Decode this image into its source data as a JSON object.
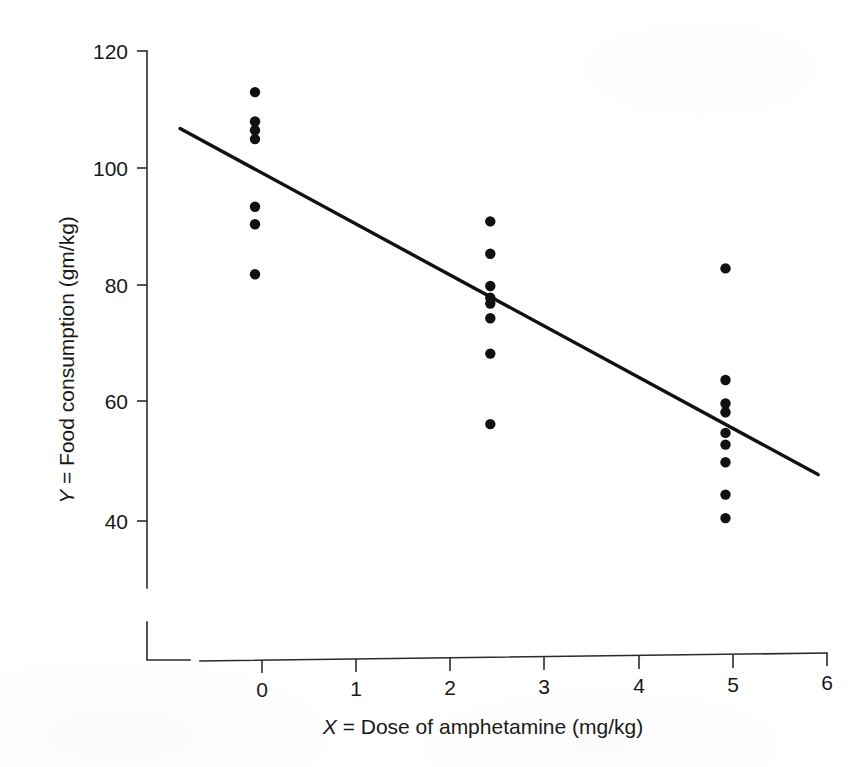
{
  "figure": {
    "name": "amphetamine-dose-food-consumption-scatter",
    "background_color": "#ffffff",
    "ink_color": "#101010"
  },
  "chart_data": {
    "type": "scatter",
    "title": "",
    "subtitle": "",
    "xlabel": "X = Dose of amphetamine (mg/kg)",
    "ylabel": "Y = Food consumption (gm/kg)",
    "xlabel_variable": "X",
    "xlabel_rest": " = Dose of amphetamine (mg/kg)",
    "ylabel_variable": "Y",
    "ylabel_rest": " = Food consumption (gm/kg)",
    "xlim": [
      0,
      6
    ],
    "ylim": [
      33,
      122
    ],
    "y_axis_broken": true,
    "grid": false,
    "legend": null,
    "xticks": [
      0,
      1,
      2,
      3,
      4,
      5,
      6
    ],
    "xtick_labels": [
      "0",
      "1",
      "2",
      "3",
      "4",
      "5",
      "6"
    ],
    "yticks": [
      40,
      60,
      80,
      100,
      120
    ],
    "ytick_labels": [
      "40",
      "60",
      "80",
      "100",
      "120"
    ],
    "groups": [
      {
        "name": "dose-0",
        "x": 0,
        "values": [
          113.0,
          108.0,
          106.5,
          105.0,
          93.5,
          90.5,
          82.0
        ]
      },
      {
        "name": "dose-2.5",
        "x": 2.5,
        "values": [
          91.0,
          85.5,
          80.0,
          78.0,
          77.0,
          74.5,
          68.5,
          56.5
        ]
      },
      {
        "name": "dose-5",
        "x": 5,
        "values": [
          83.0,
          64.0,
          60.0,
          58.5,
          55.0,
          53.0,
          50.0,
          44.5,
          40.5
        ]
      }
    ],
    "points": [
      {
        "x": 0,
        "y": 113.0
      },
      {
        "x": 0,
        "y": 108.0
      },
      {
        "x": 0,
        "y": 106.5
      },
      {
        "x": 0,
        "y": 105.0
      },
      {
        "x": 0,
        "y": 93.5
      },
      {
        "x": 0,
        "y": 90.5
      },
      {
        "x": 0,
        "y": 82.0
      },
      {
        "x": 2.5,
        "y": 91.0
      },
      {
        "x": 2.5,
        "y": 85.5
      },
      {
        "x": 2.5,
        "y": 80.0
      },
      {
        "x": 2.5,
        "y": 78.0
      },
      {
        "x": 2.5,
        "y": 77.0
      },
      {
        "x": 2.5,
        "y": 74.5
      },
      {
        "x": 2.5,
        "y": 68.5
      },
      {
        "x": 2.5,
        "y": 56.5
      },
      {
        "x": 5,
        "y": 83.0
      },
      {
        "x": 5,
        "y": 64.0
      },
      {
        "x": 5,
        "y": 60.0
      },
      {
        "x": 5,
        "y": 58.5
      },
      {
        "x": 5,
        "y": 55.0
      },
      {
        "x": 5,
        "y": 53.0
      },
      {
        "x": 5,
        "y": 50.0
      },
      {
        "x": 5,
        "y": 44.5
      },
      {
        "x": 5,
        "y": 40.5
      }
    ],
    "fit_line": {
      "name": "least-squares-regression-line",
      "x_start": -0.87,
      "y_start": 106.8,
      "x_end": 5.91,
      "y_end": 47.9,
      "color": "#111111"
    }
  }
}
